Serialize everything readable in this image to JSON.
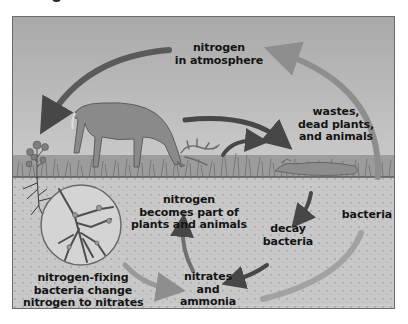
{
  "diagram": {
    "type": "nitrogen-cycle",
    "colors": {
      "sky": "#b9b9b9",
      "soil": "#c6c6c6",
      "arrow_dark": "#4a4a4a",
      "arrow_light": "#9a9a9a",
      "text": "#141414",
      "frame_border": "#6a6a6a"
    },
    "labels": {
      "atmosphere": {
        "line1": "nitrogen",
        "line2": "in atmosphere"
      },
      "wastes": {
        "line1": "wastes,",
        "line2": "dead plants,",
        "line3": "and animals"
      },
      "bacteria": {
        "line1": "bacteria"
      },
      "nitrogen_part": {
        "line1": "nitrogen",
        "line2": "becomes part of",
        "line3": "plants and animals"
      },
      "decay": {
        "line1": "decay",
        "line2": "bacteria"
      },
      "nitrates": {
        "line1": "nitrates",
        "line2": "and",
        "line3": "ammonia"
      },
      "fixing": {
        "line1": "nitrogen-fixing",
        "line2": "bacteria change",
        "line3": "nitrogen to nitrates"
      }
    },
    "illustrations": {
      "deer": "grazing-deer",
      "plant": "small-plant-with-roots",
      "magnifier": "root-nodules-closeup",
      "decomposer": "dead-animal-in-grass"
    },
    "arrows": [
      {
        "from": "atmosphere",
        "to": "plant",
        "style": "dark"
      },
      {
        "from": "bacteria",
        "to": "atmosphere",
        "style": "light"
      },
      {
        "from": "deer",
        "to": "wastes",
        "style": "dark"
      },
      {
        "from": "antlers",
        "to": "wastes",
        "style": "dark"
      },
      {
        "from": "wastes",
        "to": "decay",
        "style": "dark"
      },
      {
        "from": "decay",
        "to": "nitrates",
        "style": "dark"
      },
      {
        "from": "nitrates",
        "to": "nitrogen_part",
        "style": "dark"
      },
      {
        "from": "fixing",
        "to": "nitrates",
        "style": "light"
      },
      {
        "from": "nitrates",
        "to": "bacteria",
        "style": "light"
      }
    ]
  }
}
